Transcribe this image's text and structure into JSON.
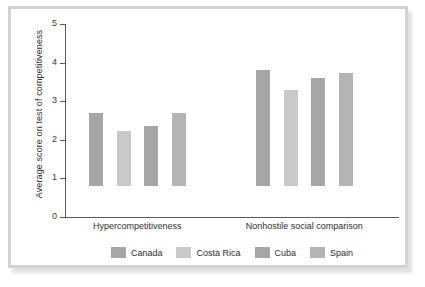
{
  "chart_data": {
    "type": "bar",
    "title": "",
    "subtitle": "",
    "xlabel": "",
    "ylabel": "Average score on test of competitiveness",
    "categories": [
      "Hypercompetitiveness",
      "Nonhostile social comparison"
    ],
    "series": [
      {
        "name": "Canada",
        "color": "#a6a6a6",
        "values": [
          1.88,
          3.0
        ]
      },
      {
        "name": "Costa Rica",
        "color": "#c9c9c9",
        "values": [
          1.42,
          2.48
        ]
      },
      {
        "name": "Cuba",
        "color": "#a6a6a6",
        "values": [
          1.56,
          2.8
        ]
      },
      {
        "name": "Spain",
        "color": "#b4b4b4",
        "values": [
          1.9,
          2.93
        ]
      }
    ],
    "ylim": [
      0,
      5
    ],
    "ytick_labels": [
      "0",
      "1",
      "2",
      "3",
      "4",
      "5"
    ],
    "ytick_values": [
      0,
      1,
      2,
      3,
      4,
      5
    ],
    "grid": false,
    "legend_position": "bottom",
    "legend_entries": [
      "Canada",
      "Costa Rica",
      "Cuba",
      "Spain"
    ]
  },
  "figure": {
    "frame_color": "#d2d2d2",
    "axis_color": "#5a5a5a",
    "background": "#ffffff"
  }
}
